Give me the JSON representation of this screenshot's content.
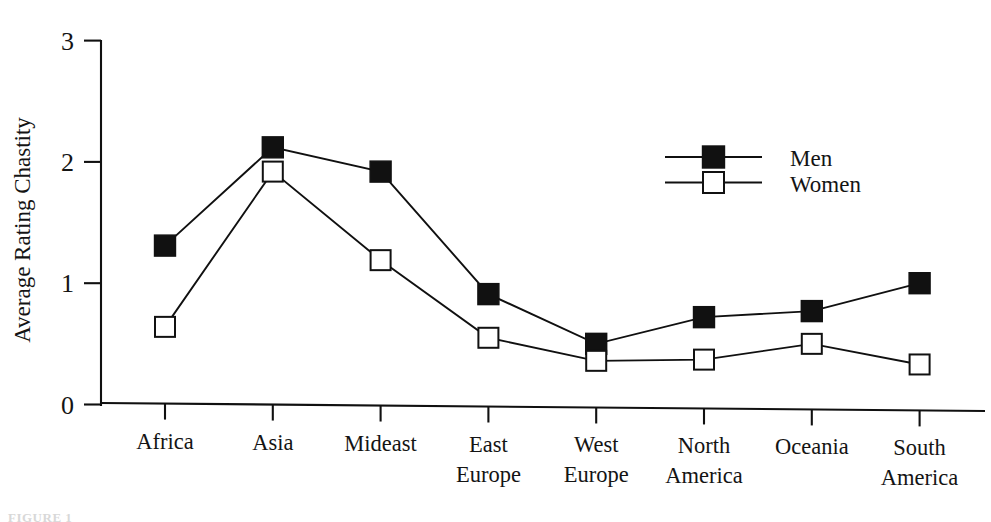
{
  "chart_data": {
    "type": "line",
    "title": "",
    "xlabel": "",
    "ylabel": "Average Rating Chastity",
    "ylim": [
      0,
      3
    ],
    "yticks": [
      0,
      1,
      2,
      3
    ],
    "ytick_labels": [
      "0",
      "1",
      "2",
      "3"
    ],
    "grid": false,
    "legend_position": "upper right",
    "categories": [
      "Africa",
      "Asia",
      "Mideast",
      "East Europe",
      "West Europe",
      "North America",
      "Oceania",
      "South America"
    ],
    "category_lines": [
      [
        "Africa"
      ],
      [
        "Asia"
      ],
      [
        "Mideast"
      ],
      [
        "East",
        "Europe"
      ],
      [
        "West",
        "Europe"
      ],
      [
        "North",
        "America"
      ],
      [
        "Oceania"
      ],
      [
        "South",
        "America"
      ]
    ],
    "series": [
      {
        "name": "Men",
        "marker": "filled-square",
        "color": "#111111",
        "values": [
          1.31,
          2.12,
          1.92,
          0.91,
          0.5,
          0.72,
          0.77,
          1.0
        ]
      },
      {
        "name": "Women",
        "marker": "open-square",
        "color": "#111111",
        "values": [
          0.64,
          1.92,
          1.19,
          0.55,
          0.36,
          0.37,
          0.5,
          0.33
        ]
      }
    ]
  },
  "legend": {
    "entries": [
      {
        "label": "Men",
        "marker": "filled-square"
      },
      {
        "label": "Women",
        "marker": "open-square"
      }
    ]
  },
  "caption": {
    "ghost_text": "FIGURE 1"
  }
}
